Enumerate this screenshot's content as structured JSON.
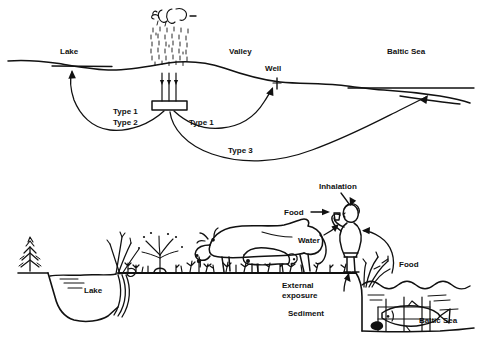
{
  "figure": {
    "background_color": "#ffffff",
    "ink_color": "#111111",
    "width": 477,
    "height": 341
  },
  "top_panel": {
    "name": "geosphere-cross-section",
    "labels": {
      "lake": "Lake",
      "valley": "Valley",
      "well": "Well",
      "baltic_sea": "Baltic Sea",
      "type1_left": "Type 1",
      "type2_left": "Type 2",
      "type1_right": "Type 1",
      "type3": "Type 3"
    },
    "icons": {
      "precipitation": "precipitation-icon",
      "clouds": "cloud-icon",
      "repository": "repository-icon",
      "shafts": "shaft-arrows-icon",
      "well_mark": "well-icon"
    }
  },
  "bottom_panel": {
    "name": "biosphere-exposure-pathways",
    "labels": {
      "lake": "Lake",
      "inhalation": "Inhalation",
      "food_left": "Food",
      "water": "Water",
      "external_exposure_line1": "External",
      "external_exposure_line2": "exposure",
      "sediment": "Sediment",
      "food_right": "Food",
      "baltic_sea": "Baltic Sea"
    },
    "icons": {
      "tree": "conifer-tree-icon",
      "reeds_left": "reeds-icon",
      "sprinkler": "irrigation-sprinkler-icon",
      "crops": "crop-plants-icon",
      "cow": "cow-icon",
      "calf": "calf-icon",
      "human": "human-figure-icon",
      "reeds_right": "reeds-icon",
      "fish": "fish-icon",
      "net": "fishing-net-icon",
      "grass": "grass-icon"
    }
  }
}
